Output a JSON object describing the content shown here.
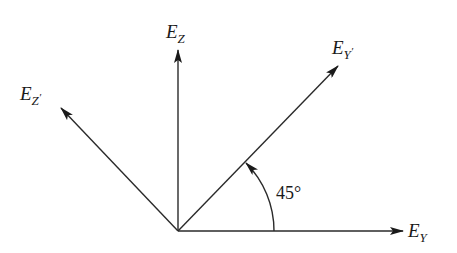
{
  "diagram": {
    "origin": {
      "x": 178,
      "y": 231
    },
    "vectors": [
      {
        "id": "ez",
        "label_main": "E",
        "label_sub": "Z",
        "label_prime": "",
        "tip": {
          "x": 178,
          "y": 50
        },
        "label_pos": {
          "x": 166,
          "y": 38
        }
      },
      {
        "id": "eyp",
        "label_main": "E",
        "label_sub": "Y",
        "label_prime": "′",
        "tip": {
          "x": 338,
          "y": 66
        },
        "label_pos": {
          "x": 332,
          "y": 54
        }
      },
      {
        "id": "ezp",
        "label_main": "E",
        "label_sub": "Z",
        "label_prime": "′",
        "tip": {
          "x": 61,
          "y": 108
        },
        "label_pos": {
          "x": 20,
          "y": 100
        }
      },
      {
        "id": "ey",
        "label_main": "E",
        "label_sub": "Y",
        "label_prime": "",
        "tip": {
          "x": 403,
          "y": 231
        },
        "label_pos": {
          "x": 408,
          "y": 237
        }
      }
    ],
    "angle": {
      "label": "45°",
      "degrees": 45,
      "radius": 96,
      "label_pos": {
        "x": 276,
        "y": 199
      }
    },
    "colors": {
      "stroke": "#2a2a2a",
      "text": "#1a1a1a",
      "background": "#ffffff"
    }
  }
}
